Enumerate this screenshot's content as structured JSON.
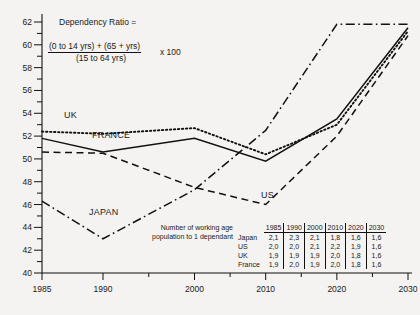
{
  "chart_data": {
    "type": "line",
    "title": "",
    "xlabel": "",
    "ylabel": "",
    "x": [
      1985,
      1990,
      2000,
      2010,
      2020,
      2030
    ],
    "xtick_labels": [
      "1985",
      "1990",
      "2000",
      "2010",
      "2020",
      "2030"
    ],
    "ytick_labels": [
      "40",
      "42",
      "44",
      "46",
      "48",
      "50",
      "52",
      "54",
      "56",
      "58",
      "60",
      "62"
    ],
    "ylim": [
      40,
      62
    ],
    "grid": false,
    "legend": "inline-labels",
    "series": [
      {
        "name": "UK",
        "style": "dotted",
        "values": [
          52.4,
          52.2,
          52.7,
          50.4,
          53.0,
          61.2
        ]
      },
      {
        "name": "FRANCE",
        "style": "solid",
        "values": [
          51.8,
          50.6,
          51.8,
          49.8,
          53.5,
          61.5
        ]
      },
      {
        "name": "US",
        "style": "dashed",
        "values": [
          50.6,
          50.5,
          47.5,
          46.0,
          52.0,
          60.8
        ]
      },
      {
        "name": "JAPAN",
        "style": "dashdot",
        "values": [
          46.3,
          43.0,
          47.3,
          52.5,
          61.8,
          61.8
        ]
      }
    ]
  },
  "formula": {
    "title": "Dependency Ratio =",
    "numerator": "(0 to 14 yrs) + (65 + yrs)",
    "denominator": "(15 to 64 yrs)",
    "multiplier": "x 100"
  },
  "table": {
    "caption_line1": "Number of working age",
    "caption_line2": "population  to 1 dependant",
    "columns": [
      "1985",
      "1990",
      "2000",
      "2010",
      "2020",
      "2030"
    ],
    "rows": [
      {
        "label": "Japan",
        "values": [
          "2,1",
          "2,3",
          "2,1",
          "1,8",
          "1,6",
          "1,6"
        ]
      },
      {
        "label": "US",
        "values": [
          "2,0",
          "2,0",
          "2,1",
          "2,2",
          "1,9",
          "1,6"
        ]
      },
      {
        "label": "UK",
        "values": [
          "1,9",
          "1,9",
          "1,9",
          "2,0",
          "1,8",
          "1,6"
        ]
      },
      {
        "label": "France",
        "values": [
          "1,9",
          "2,0",
          "1,9",
          "2,0",
          "1,8",
          "1,6"
        ]
      }
    ]
  },
  "series_labels": {
    "uk": "UK",
    "france": "FRANCE",
    "japan": "JAPAN",
    "us": "US"
  }
}
